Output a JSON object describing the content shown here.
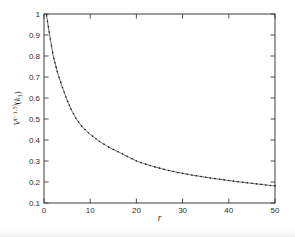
{
  "window": {
    "background": "#ffffff"
  },
  "chart_data": {
    "type": "line",
    "title": "",
    "xlabel": "r",
    "ylabel": "V^(−1.5)(k_1)",
    "ylabel_parts": {
      "base": "V",
      "sup": "(−1.5)",
      "paren_open": "(",
      "arg": "k",
      "sub": "1",
      "paren_close": ")"
    },
    "xlim": [
      0,
      50
    ],
    "ylim": [
      0.1,
      1.0
    ],
    "x_ticks": [
      0,
      10,
      20,
      30,
      40,
      50
    ],
    "x_tick_labels": [
      "0",
      "10",
      "20",
      "30",
      "40",
      "50"
    ],
    "y_ticks": [
      0.1,
      0.2,
      0.3,
      0.4,
      0.5,
      0.6,
      0.7,
      0.8,
      0.9,
      1.0
    ],
    "y_tick_labels": [
      "0.1",
      "0.2",
      "0.3",
      "0.4",
      "0.5",
      "0.6",
      "0.7",
      "0.8",
      "0.9",
      "1"
    ],
    "grid": false,
    "legend": "none",
    "box": true,
    "tick_direction": "in",
    "axis_color": "#3c3c3c",
    "text_color": "#2e2e2e",
    "curve_style": {
      "color": "#1a1a1a",
      "line": "solid-thin",
      "markers": "dots"
    },
    "series": [
      {
        "name": "V^(−1.5)(k_1)",
        "x": [
          0.5,
          1,
          2,
          3,
          4,
          5,
          6,
          7,
          8,
          9,
          10,
          12,
          14,
          16,
          18,
          20,
          22,
          24,
          26,
          28,
          30,
          32,
          34,
          36,
          38,
          40,
          42,
          44,
          46,
          48,
          50
        ],
        "y": [
          1.0,
          0.93,
          0.8,
          0.715,
          0.65,
          0.59,
          0.54,
          0.5,
          0.47,
          0.447,
          0.427,
          0.393,
          0.366,
          0.344,
          0.322,
          0.3,
          0.285,
          0.272,
          0.26,
          0.25,
          0.241,
          0.233,
          0.226,
          0.219,
          0.213,
          0.207,
          0.201,
          0.196,
          0.191,
          0.186,
          0.181
        ]
      }
    ]
  }
}
